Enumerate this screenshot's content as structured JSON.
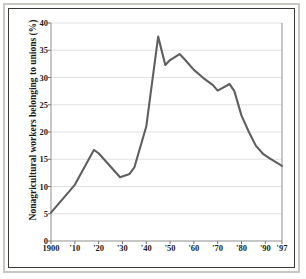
{
  "chart_data": {
    "type": "line",
    "title": "",
    "xlabel": "",
    "ylabel": "Nonagricultural workers belonging to unions (%)",
    "ylim": [
      0,
      40
    ],
    "xlim": [
      1900,
      1997
    ],
    "grid": true,
    "legend": "none",
    "ytick_labels": [
      "0",
      "5",
      "10",
      "15",
      "20",
      "25",
      "30",
      "35",
      "40"
    ],
    "ytick_values": [
      0,
      5,
      10,
      15,
      20,
      25,
      30,
      35,
      40
    ],
    "xtick_labels": [
      "1900",
      "'10",
      "'20",
      "'30",
      "'40",
      "'50",
      "'60",
      "'70",
      "'80",
      "'90",
      "'97"
    ],
    "xtick_values": [
      1900,
      1910,
      1920,
      1930,
      1940,
      1950,
      1960,
      1970,
      1980,
      1990,
      1997
    ],
    "series": [
      {
        "name": "Union membership",
        "color": "#605f5d",
        "x": [
          1900,
          1910,
          1918,
          1920,
          1929,
          1933,
          1935,
          1940,
          1945,
          1948,
          1950,
          1954,
          1956,
          1960,
          1964,
          1968,
          1970,
          1975,
          1977,
          1980,
          1983,
          1986,
          1989,
          1992,
          1997
        ],
        "values": [
          5.2,
          10.3,
          16.7,
          16.1,
          11.7,
          12.3,
          13.5,
          21.0,
          37.5,
          32.3,
          33.2,
          34.3,
          33.4,
          31.4,
          29.9,
          28.6,
          27.6,
          28.8,
          27.5,
          23.0,
          20.1,
          17.5,
          16.0,
          15.1,
          13.8
        ]
      }
    ]
  },
  "axis": {
    "y_label_text": "Nonagricultural workers belonging to unions (%)"
  }
}
